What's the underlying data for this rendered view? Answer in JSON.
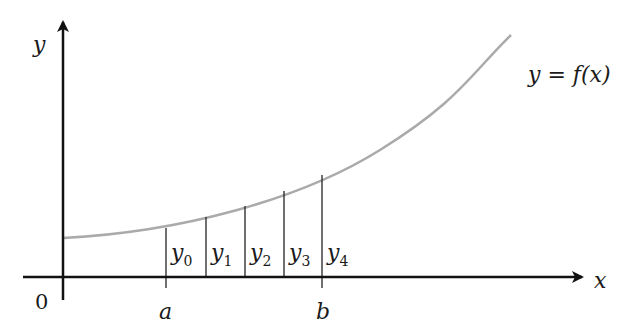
{
  "diagram": {
    "type": "trapezoidal-rule-ordinates",
    "axes": {
      "x_label": "x",
      "y_label": "y",
      "origin_label": "0"
    },
    "curve": {
      "label": "y = f(x)",
      "color": "#aaaaaa",
      "description": "increasing convex curve"
    },
    "interval": {
      "start_label": "a",
      "end_label": "b"
    },
    "ordinates": [
      {
        "base": "y",
        "sub": "0"
      },
      {
        "base": "y",
        "sub": "1"
      },
      {
        "base": "y",
        "sub": "2"
      },
      {
        "base": "y",
        "sub": "3"
      },
      {
        "base": "y",
        "sub": "4"
      }
    ],
    "colors": {
      "axis": "#111111",
      "ordinate_lines": "#222222",
      "curve": "#aaaaaa",
      "background": "#ffffff"
    }
  }
}
